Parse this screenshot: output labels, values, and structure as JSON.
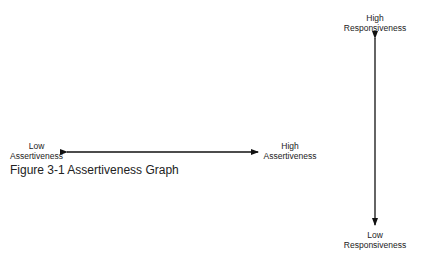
{
  "figure": {
    "caption": "Figure 3-1 Assertiveness Graph",
    "horizontal_axis": {
      "left_label_line1": "Low",
      "left_label_line2": "Assertiveness",
      "right_label_line1": "High",
      "right_label_line2": "Assertiveness"
    },
    "vertical_axis": {
      "top_label_line1": "High",
      "top_label_line2": "Responsiveness",
      "bottom_label_line1": "Low",
      "bottom_label_line2": "Responsiveness"
    },
    "line_color": "#111111"
  }
}
